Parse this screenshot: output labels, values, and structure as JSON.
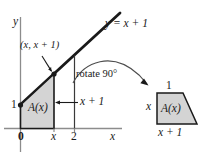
{
  "figure": {
    "kind": "math-diagram",
    "colors": {
      "ink": "#1a1a1a",
      "axis": "#8c8c8c",
      "shade_fill": "#d4d4d4",
      "shade_stroke": "#1a1a1a",
      "thin_curve": "#4d4d4d"
    }
  },
  "left_graph": {
    "y_axis_label": "y",
    "x_axis_label": "x",
    "line_label": "y = x + 1",
    "point_label": "(x, x + 1)",
    "region_label": "A(x)",
    "height_label": "x + 1",
    "y_intercept_tick": "1",
    "x_ticks": [
      "0",
      "x",
      "2"
    ]
  },
  "rotation": {
    "label": "rotate 90°"
  },
  "right_figure": {
    "top_label": "1",
    "left_label": "x",
    "bottom_label": "x + 1",
    "region_label": "A(x)"
  }
}
